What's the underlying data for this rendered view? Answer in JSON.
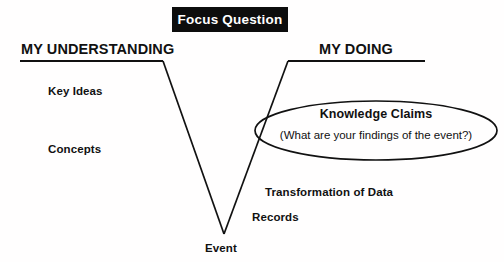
{
  "diagram": {
    "title_banner": {
      "label": "Focus Question"
    },
    "headings": {
      "left": "MY UNDERSTANDING",
      "right": "MY DOING"
    },
    "left_items": [
      {
        "label": "Key Ideas"
      },
      {
        "label": "Concepts"
      }
    ],
    "right_items": [
      {
        "label": "Transformation of Data"
      },
      {
        "label": "Records"
      }
    ],
    "ellipse": {
      "title": "Knowledge Claims",
      "subtitle": "(What are your findings of the event?)"
    },
    "apex": {
      "label": "Event"
    },
    "colors": {
      "banner_background": "#0d0d0d",
      "banner_text": "#ffffff",
      "ink": "#111111",
      "page_background": "#fffefe"
    }
  }
}
